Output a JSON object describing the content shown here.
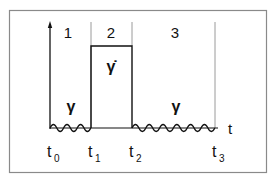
{
  "diagram": {
    "regions": [
      {
        "label": "1"
      },
      {
        "label": "2"
      },
      {
        "label": "3"
      }
    ],
    "region_symbols": {
      "region1": "γ",
      "region2": "γ̇",
      "region3": "γ"
    },
    "axis": {
      "x_label": "t"
    },
    "time_marks": [
      {
        "base": "t",
        "sub": "0"
      },
      {
        "base": "t",
        "sub": "1"
      },
      {
        "base": "t",
        "sub": "2"
      },
      {
        "base": "t",
        "sub": "3"
      }
    ],
    "colors": {
      "line": "#111111",
      "divider": "#9a9a9a",
      "frame": "#8a8a8a",
      "background": "#ffffff"
    }
  }
}
